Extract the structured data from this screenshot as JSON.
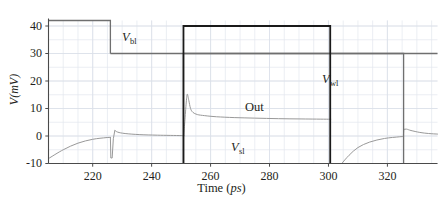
{
  "chart_data": {
    "type": "line",
    "title": "",
    "xlabel": "Time (ps)",
    "xlabel_main": "Time",
    "xlabel_unit": "ps",
    "ylabel": "V(mV)",
    "ylabel_main": "V",
    "ylabel_unit": "mV",
    "xlim": [
      205,
      337
    ],
    "ylim": [
      -10,
      42
    ],
    "xticks": [
      220,
      240,
      260,
      280,
      300,
      320
    ],
    "yticks": [
      -10,
      0,
      10,
      20,
      30,
      40
    ],
    "grid": true,
    "grid_minor_x_step": 5,
    "grid_minor_y_step": 5,
    "legend": "inline-annotations",
    "annotations": [
      {
        "name": "Vbl",
        "symbol": "V",
        "subscript": "bl",
        "x_px": 122,
        "y_px": 30
      },
      {
        "name": "Vwl",
        "symbol": "V",
        "subscript": "wl",
        "x_px": 322,
        "y_px": 72
      },
      {
        "name": "Vsl",
        "symbol": "V",
        "subscript": "sl",
        "x_px": 231,
        "y_px": 140
      },
      {
        "name": "Out",
        "symbol": "Out",
        "subscript": "",
        "x_px": 245,
        "y_px": 100
      }
    ],
    "series": [
      {
        "name": "Vbl",
        "color": "#6f6f6f",
        "width": 1.3,
        "style": "digital-pulse",
        "low": 0,
        "high": 30,
        "points": [
          [
            205,
            30
          ],
          [
            226.0,
            30
          ],
          [
            226.0,
            0
          ]
        ],
        "note": "Trace drawn at 30 mV from left edge, drops at 226 ps; vertical segment then horizontal at 30 mV continues right across full plot"
      },
      {
        "name": "Vbl_level",
        "color": "#6f6f6f",
        "width": 1.3,
        "style": "line",
        "points": [
          [
            226.0,
            30
          ],
          [
            337,
            30
          ]
        ]
      },
      {
        "name": "Vbl_top",
        "color": "#6f6f6f",
        "width": 1.3,
        "style": "line",
        "points": [
          [
            205,
            42
          ],
          [
            226.0,
            42
          ],
          [
            226.0,
            30
          ]
        ]
      },
      {
        "name": "Out",
        "color": "#1a1a1a",
        "width": 1.8,
        "style": "digital-pulse",
        "low": -10,
        "high": 40,
        "points": [
          [
            205,
            -10
          ],
          [
            250.8,
            -10
          ],
          [
            250.8,
            40
          ],
          [
            300.6,
            40
          ],
          [
            300.6,
            -10
          ],
          [
            337,
            -10
          ]
        ]
      },
      {
        "name": "Vwl",
        "color": "#6f6f6f",
        "width": 1.3,
        "style": "digital-pulse",
        "low": -10,
        "high": 30,
        "points": [
          [
            250.8,
            -10
          ],
          [
            250.8,
            30
          ],
          [
            325.5,
            30
          ],
          [
            325.5,
            -10
          ]
        ]
      },
      {
        "name": "Vsl",
        "color": "#999999",
        "width": 1.0,
        "style": "analog",
        "description": "Analog node voltage: exponential recovery from -10 mV to 0 mV, negative glitch to -8 mV at 226 ps, positive overshoot to +2 mV then decay; repeats after 300 ps with recovery from -10 mV and overshoot to +2.5 mV at 325 ps",
        "key_points": [
          [
            205,
            -8.2
          ],
          [
            210,
            -5.0
          ],
          [
            215,
            -2.6
          ],
          [
            220,
            -1.2
          ],
          [
            224.5,
            -0.6
          ],
          [
            226.0,
            -0.5
          ],
          [
            226.2,
            -8.0
          ],
          [
            226.6,
            -8.0
          ],
          [
            227.0,
            -1.5
          ],
          [
            227.6,
            2.0
          ],
          [
            228.5,
            1.4
          ],
          [
            231,
            0.9
          ],
          [
            236,
            0.5
          ],
          [
            242,
            0.3
          ],
          [
            250,
            0.15
          ],
          [
            250.8,
            0.1
          ],
          [
            251.0,
            0.1
          ],
          [
            304.5,
            -10.0
          ],
          [
            307,
            -7.0
          ],
          [
            310,
            -4.2
          ],
          [
            314,
            -2.2
          ],
          [
            319,
            -0.9
          ],
          [
            324,
            -0.3
          ],
          [
            325.3,
            -0.2
          ],
          [
            325.6,
            2.4
          ],
          [
            326.5,
            2.5
          ],
          [
            328,
            2.0
          ],
          [
            331,
            1.3
          ],
          [
            334,
            0.9
          ],
          [
            337,
            0.7
          ]
        ]
      },
      {
        "name": "Out_analog",
        "color": "#999999",
        "width": 1.0,
        "style": "analog",
        "description": "Out node analog response: spikes to 15.2 mV just after 251 ps, decays to ~6 mV plateau by 300 ps",
        "key_points": [
          [
            250.9,
            0.2
          ],
          [
            251.3,
            6.0
          ],
          [
            251.8,
            13.0
          ],
          [
            252.1,
            15.2
          ],
          [
            252.6,
            13.0
          ],
          [
            253.2,
            10.0
          ],
          [
            254.0,
            8.6
          ],
          [
            255.5,
            7.8
          ],
          [
            258,
            7.4
          ],
          [
            262,
            7.0
          ],
          [
            268,
            6.7
          ],
          [
            275,
            6.5
          ],
          [
            283,
            6.3
          ],
          [
            291,
            6.2
          ],
          [
            300,
            6.1
          ],
          [
            300.6,
            6.1
          ]
        ]
      }
    ]
  },
  "axes": {
    "x_tick_labels": [
      "220",
      "240",
      "260",
      "280",
      "300",
      "320"
    ],
    "y_tick_labels": [
      "40",
      "30",
      "20",
      "10",
      "0",
      "-10"
    ]
  }
}
